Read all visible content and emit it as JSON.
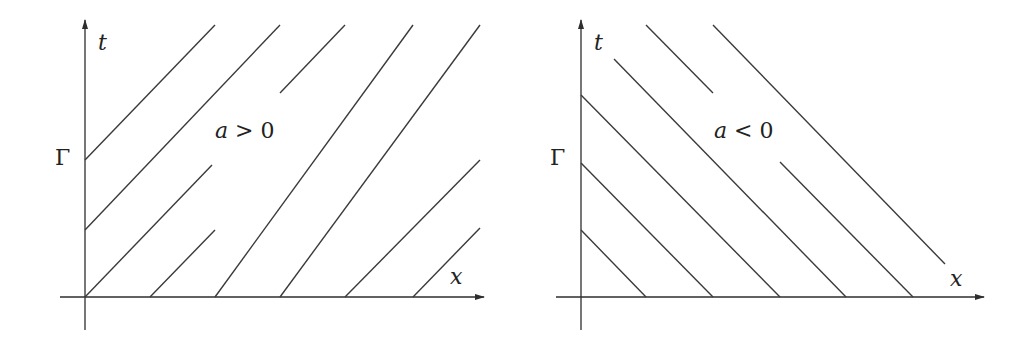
{
  "figure": {
    "panels": [
      {
        "id": "left",
        "condition_label": "a > 0",
        "t_axis_label": "t",
        "x_axis_label": "x",
        "boundary_label": "Γ",
        "description": "Characteristic lines with positive slope"
      },
      {
        "id": "right",
        "condition_label": "a < 0",
        "t_axis_label": "t",
        "x_axis_label": "x",
        "boundary_label": "Γ",
        "description": "Characteristic lines with negative slope"
      }
    ]
  },
  "colors": {
    "line": "#3a3a3a",
    "background": "#ffffff"
  }
}
